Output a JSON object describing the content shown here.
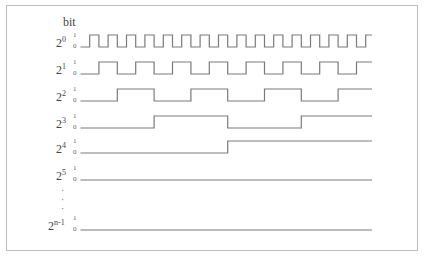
{
  "diagram": {
    "title": "bit",
    "type": "binary counter timing diagram",
    "level_labels": {
      "high": "1",
      "low": "0"
    },
    "colors": {
      "line": "#7a7a7a",
      "frame": "#bdbdbd",
      "text": "#444444"
    },
    "timeline": {
      "x_start": 80.5,
      "x_end": 372,
      "unit": 9.2
    },
    "rows": [
      {
        "base": "2",
        "exp": "0",
        "y_low": 47,
        "half_period_units": 1
      },
      {
        "base": "2",
        "exp": "1",
        "y_low": 74,
        "half_period_units": 2
      },
      {
        "base": "2",
        "exp": "2",
        "y_low": 101,
        "half_period_units": 4
      },
      {
        "base": "2",
        "exp": "3",
        "y_low": 128,
        "half_period_units": 8
      },
      {
        "base": "2",
        "exp": "4",
        "y_low": 153,
        "half_period_units": 16
      },
      {
        "base": "2",
        "exp": "5",
        "y_low": 180,
        "half_period_units": 32
      },
      {
        "base": "2",
        "exp": "n-1",
        "y_low": 230,
        "half_period_units": 0
      }
    ],
    "ellipsis": [
      "·",
      "·",
      "·"
    ]
  }
}
